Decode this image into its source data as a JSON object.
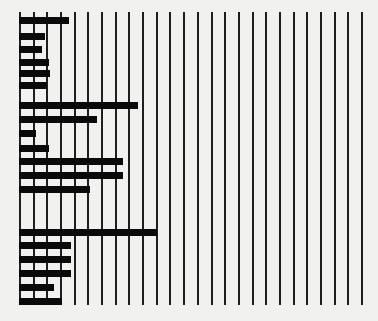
{
  "chart_data": {
    "type": "bar",
    "orientation": "horizontal",
    "title": "",
    "xlabel": "",
    "ylabel": "",
    "grid": {
      "vertical": true,
      "horizontal": false,
      "line_count": 26
    },
    "xlim": [
      0,
      25
    ],
    "categories": [
      "1",
      "2",
      "3",
      "4",
      "5",
      "6",
      "7",
      "8",
      "9",
      "10",
      "11",
      "12",
      "13",
      "14",
      "15",
      "16",
      "17",
      "18",
      "19"
    ],
    "values": [
      3.6,
      1.8,
      1.6,
      2.1,
      2.2,
      2.0,
      8.6,
      5.6,
      1.2,
      2.1,
      7.5,
      7.5,
      5.1,
      10.0,
      3.7,
      3.7,
      3.7,
      2.5,
      3.1
    ],
    "bar_y_positions": [
      17,
      33,
      46,
      59,
      70,
      82,
      102,
      116,
      130,
      145,
      158,
      172,
      186,
      229,
      242,
      256,
      270,
      284,
      298
    ],
    "colors": {
      "bar": "#0a0a0a",
      "grid": "#1e1e1e",
      "background": "#f1f1ef"
    }
  },
  "layout": {
    "origin_x": 20,
    "unit_px": 13.68,
    "grid_top": 12,
    "grid_bottom": 305
  }
}
